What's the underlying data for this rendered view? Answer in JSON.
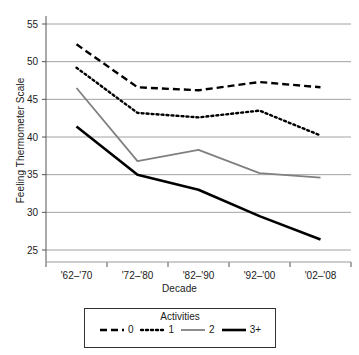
{
  "chart_data": {
    "type": "line",
    "title": "",
    "xlabel": "Decade",
    "ylabel": "Feeling Thermometer Scale",
    "categories": [
      "'62–'70",
      "'72–'80",
      "'82–'90",
      "'92–'00",
      "'02–'08"
    ],
    "ylim": [
      25,
      55
    ],
    "yticks": [
      25,
      30,
      35,
      40,
      45,
      50,
      55
    ],
    "grid": "horizontal",
    "legend_position": "bottom",
    "legend_title": "Activities",
    "series": [
      {
        "name": "0",
        "style": "dashed",
        "color": "#000000",
        "values": [
          52.3,
          46.6,
          46.2,
          47.3,
          46.6
        ]
      },
      {
        "name": "1",
        "style": "dotted",
        "color": "#000000",
        "values": [
          49.2,
          43.2,
          42.6,
          43.5,
          40.2
        ]
      },
      {
        "name": "2",
        "style": "solid",
        "color": "#808080",
        "values": [
          46.5,
          36.8,
          38.3,
          35.2,
          34.6
        ]
      },
      {
        "name": "3+",
        "style": "solid-bold",
        "color": "#000000",
        "values": [
          41.4,
          35.0,
          33.0,
          29.5,
          26.4
        ]
      }
    ]
  },
  "legend": {
    "title": "Activities",
    "items": [
      {
        "label": "0",
        "icon": "dashed-line-swatch"
      },
      {
        "label": "1",
        "icon": "dotted-line-swatch"
      },
      {
        "label": "2",
        "icon": "gray-solid-line-swatch"
      },
      {
        "label": "3+",
        "icon": "black-solid-line-swatch"
      }
    ]
  },
  "axes": {
    "y_title": "Feeling Thermometer Scale",
    "x_title": "Decade",
    "y_tick_labels": [
      "55",
      "50",
      "45",
      "40",
      "35",
      "30",
      "25"
    ],
    "x_tick_labels": [
      "'62–'70",
      "'72–'80",
      "'82–'90",
      "'92–'00",
      "'02–'08"
    ]
  }
}
